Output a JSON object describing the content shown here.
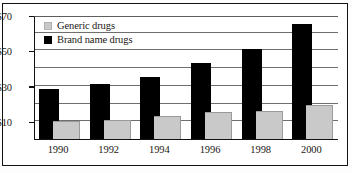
{
  "chart_data": {
    "type": "bar",
    "title": "",
    "subtitle": "",
    "xlabel": "",
    "ylabel": "",
    "categories": [
      "1990",
      "1992",
      "1994",
      "1996",
      "1998",
      "2000"
    ],
    "series": [
      {
        "name": "Generic drugs",
        "color": "#c9c9c9",
        "values": [
          10,
          11,
          13,
          15,
          16,
          19
        ]
      },
      {
        "name": "Brand name drugs",
        "color": "#000000",
        "values": [
          28,
          31,
          35,
          43,
          51,
          65
        ]
      }
    ],
    "ylim": [
      0,
      70
    ],
    "ytick_values": [
      10,
      30,
      50,
      70
    ],
    "ytick_labels": [
      "$10",
      "$30",
      "$50",
      "$70"
    ],
    "gridline_values": [
      10,
      20,
      30,
      40,
      50,
      60,
      70
    ],
    "grid": true,
    "legend_position": "top-left",
    "bar_style": "overlapping",
    "value_prefix": "$"
  },
  "legend": {
    "items": [
      {
        "label": "Generic drugs",
        "swatch": "generic"
      },
      {
        "label": "Brand name drugs",
        "swatch": "brand"
      }
    ]
  }
}
